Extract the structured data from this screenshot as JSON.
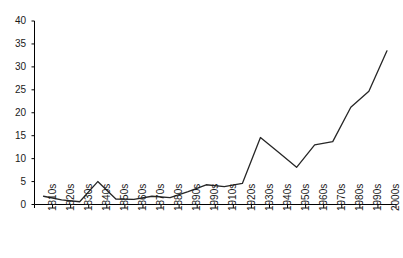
{
  "chart_data": {
    "type": "line",
    "title": "",
    "subtitle": "",
    "xlabel": "",
    "ylabel": "",
    "categories": [
      "1810s",
      "1820s",
      "1830s",
      "1840s",
      "1850s",
      "1860s",
      "1870s",
      "1880s",
      "1890s",
      "1990s",
      "1910s",
      "1920s",
      "1930s",
      "1940s",
      "1950s",
      "1960s",
      "1970s",
      "1980s",
      "1990s",
      "2000s"
    ],
    "values": [
      1.8,
      1.0,
      0.6,
      5.0,
      1.2,
      1.1,
      1.8,
      1.5,
      2.8,
      4.3,
      3.9,
      4.6,
      14.6,
      11.4,
      8.1,
      13.0,
      13.7,
      21.2,
      24.7,
      33.5
    ],
    "ylim": [
      0,
      40
    ],
    "yticks": [
      0,
      5,
      10,
      15,
      20,
      25,
      30,
      35,
      40
    ],
    "ytick_labels": [
      "0",
      "5",
      "10",
      "15",
      "20",
      "25",
      "30",
      "35",
      "40"
    ],
    "grid": false,
    "legend": false,
    "legend_position": "none",
    "series_color": "#262626",
    "axis_color": "#000000",
    "background_color": "#ffffff"
  }
}
